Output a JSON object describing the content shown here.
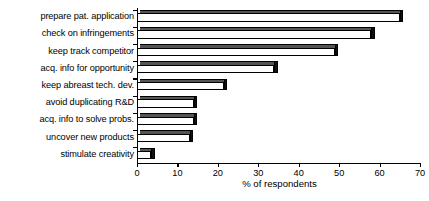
{
  "chart_data": {
    "type": "bar",
    "orientation": "horizontal",
    "title": "",
    "xlabel": "% of respondents",
    "ylabel": "",
    "xlim": [
      0,
      70
    ],
    "xticks": [
      0,
      10,
      20,
      30,
      40,
      50,
      60,
      70
    ],
    "grid": false,
    "legend": null,
    "categories": [
      "prepare pat. application",
      "check on infringements",
      "keep track competitor",
      "acq. info for opportunity",
      "keep abreast tech. dev.",
      "avoid duplicating R&D",
      "acq. info to solve probs.",
      "uncover new products",
      "stimulate creativity"
    ],
    "values": [
      65,
      58,
      49,
      34,
      21.5,
      14,
      14,
      13,
      3.5
    ],
    "bar_style": {
      "face_color": "#ffffff",
      "edge_color": "#000000",
      "top_face_color": "#555555",
      "side_face_color": "#111111"
    }
  }
}
